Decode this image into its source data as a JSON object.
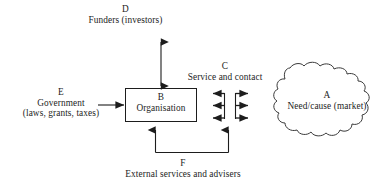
{
  "diagram": {
    "background_color": "#ffffff",
    "stroke_color": "#1d1d1d",
    "nodes": {
      "a": {
        "key": "A",
        "label": "Need/cause (market)",
        "shape": "cloud"
      },
      "b": {
        "key": "B",
        "label": "Organisation",
        "shape": "rectangle"
      },
      "c": {
        "key": "C",
        "label": "Service and contact",
        "shape": "label"
      },
      "d": {
        "key": "D",
        "label": "Funders (investors)",
        "shape": "label"
      },
      "e": {
        "key": "E",
        "label_line1": "Government",
        "label_line2": "(laws, grants, taxes)",
        "shape": "label"
      },
      "f": {
        "key": "F",
        "label": "External services and advisers",
        "shape": "label"
      }
    },
    "connectors": [
      {
        "name": "d-to-b",
        "from": "D",
        "to": "B",
        "style": "double-headed vertical arrow"
      },
      {
        "name": "e-to-b",
        "from": "E",
        "to": "B",
        "style": "single arrow pointing right"
      },
      {
        "name": "b-to-a",
        "from": "B",
        "to": "A",
        "style": "three paired bidirectional arrows with two vertical rails"
      },
      {
        "name": "f-to-b-and-c",
        "from": "F",
        "to": "B and C",
        "style": "bracket with two upward arrows"
      }
    ]
  }
}
